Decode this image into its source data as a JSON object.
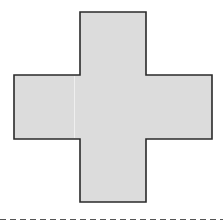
{
  "diagram": {
    "type": "net",
    "shape": "cross",
    "fill": "#dcdcdc",
    "stroke": "#2a2a2a",
    "seam_color": "#f4f4f4",
    "baseline_color": "#555555",
    "squares": [
      {
        "id": "top",
        "x": 80,
        "y": 12,
        "w": 66,
        "h": 63
      },
      {
        "id": "left",
        "x": 14,
        "y": 75,
        "w": 66,
        "h": 64
      },
      {
        "id": "center",
        "x": 80,
        "y": 75,
        "w": 66,
        "h": 64
      },
      {
        "id": "right",
        "x": 146,
        "y": 75,
        "w": 66,
        "h": 64
      },
      {
        "id": "bottom",
        "x": 80,
        "y": 139,
        "w": 66,
        "h": 63
      }
    ]
  }
}
